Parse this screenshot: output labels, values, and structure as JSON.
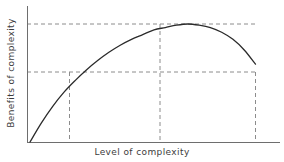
{
  "chart_data": {
    "type": "line",
    "title": "",
    "xlabel": "Level of complexity",
    "ylabel": "Benefits of complexity",
    "grid": false,
    "legend": null,
    "xlim": [
      0,
      1
    ],
    "ylim": [
      0,
      1
    ],
    "axis_ticks": {
      "x": [],
      "y": []
    },
    "series": [
      {
        "name": "Benefits of complexity",
        "description": "Inverted-U curve: benefits rise steeply with increasing complexity, reach a maximum, then decline.",
        "x": [
          0.0,
          0.05,
          0.1,
          0.15,
          0.2,
          0.25,
          0.3,
          0.35,
          0.4,
          0.45,
          0.5,
          0.55,
          0.6,
          0.65,
          0.7,
          0.75,
          0.8,
          0.85,
          0.9,
          0.95,
          1.0
        ],
        "y": [
          0.0,
          0.16,
          0.3,
          0.42,
          0.52,
          0.61,
          0.69,
          0.76,
          0.82,
          0.87,
          0.91,
          0.95,
          0.97,
          0.99,
          1.0,
          0.99,
          0.97,
          0.93,
          0.87,
          0.78,
          0.66
        ]
      }
    ],
    "reference_lines": [
      {
        "name": "optimum-benefit-level",
        "orientation": "horizontal",
        "style": "dashed",
        "y": 1.0,
        "label": ""
      },
      {
        "name": "threshold-benefit-level",
        "orientation": "horizontal",
        "style": "dashed",
        "y": 0.66,
        "label": ""
      },
      {
        "name": "lower-crossing-complexity",
        "orientation": "vertical",
        "style": "dashed",
        "x": 0.175,
        "label": ""
      },
      {
        "name": "optimum-complexity",
        "orientation": "vertical",
        "style": "dashed",
        "x": 0.575,
        "label": ""
      },
      {
        "name": "upper-crossing-complexity",
        "orientation": "vertical",
        "style": "dashed",
        "x": 1.0,
        "label": ""
      }
    ],
    "colors": {
      "curve": "#2b2b2b",
      "axis": "#6e6e6e",
      "dashed": "#8c8c8c",
      "text": "#3c3c3c",
      "background": "#ffffff"
    }
  }
}
